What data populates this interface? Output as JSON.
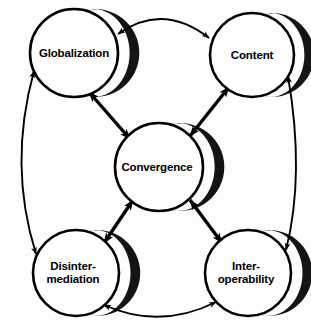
{
  "diagram": {
    "background_color": "#fdfdfd",
    "stroke_color": "#000000",
    "shadow_color": "#111111",
    "nodes": [
      {
        "id": "globalization",
        "label": "Globalization",
        "cx": 74,
        "cy": 53,
        "r": 44,
        "shadow": "right"
      },
      {
        "id": "content",
        "label": "Content",
        "cx": 252,
        "cy": 55,
        "r": 42,
        "shadow": "right"
      },
      {
        "id": "convergence",
        "label": "Convergence",
        "cx": 159,
        "cy": 167,
        "r": 44,
        "shadow": "right"
      },
      {
        "id": "disintermediation",
        "label": "Disinter-\nmediation",
        "cx": 76,
        "cy": 273,
        "r": 43,
        "shadow": "right"
      },
      {
        "id": "interoperability",
        "label": "Inter-\noperability",
        "cx": 248,
        "cy": 273,
        "r": 43,
        "shadow": "right"
      }
    ],
    "edges": [
      {
        "id": "globalization-content",
        "from": "globalization",
        "to": "content",
        "style": "arc-thin",
        "direction": "bidirectional"
      },
      {
        "id": "globalization-disintermediation",
        "from": "globalization",
        "to": "disintermediation",
        "style": "arc-thin",
        "direction": "bidirectional"
      },
      {
        "id": "content-interoperability",
        "from": "content",
        "to": "interoperability",
        "style": "arc-thin",
        "direction": "bidirectional"
      },
      {
        "id": "disintermediation-interoperability",
        "from": "disintermediation",
        "to": "interoperability",
        "style": "arc-thin",
        "direction": "bidirectional"
      },
      {
        "id": "globalization-convergence",
        "from": "globalization",
        "to": "convergence",
        "style": "spoke-thick",
        "direction": "bidirectional"
      },
      {
        "id": "content-convergence",
        "from": "content",
        "to": "convergence",
        "style": "spoke-thick",
        "direction": "bidirectional"
      },
      {
        "id": "disintermediation-convergence",
        "from": "disintermediation",
        "to": "convergence",
        "style": "spoke-thick",
        "direction": "bidirectional"
      },
      {
        "id": "interoperability-convergence",
        "from": "interoperability",
        "to": "convergence",
        "style": "spoke-thick",
        "direction": "bidirectional"
      }
    ]
  }
}
